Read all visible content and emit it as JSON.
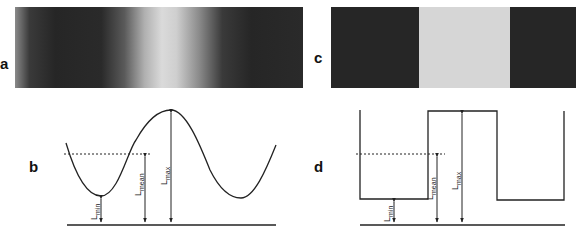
{
  "panels": {
    "a": {
      "label": "a",
      "type": "sinusoidal-grating"
    },
    "b": {
      "label": "b",
      "type": "sinusoidal-luminance-profile"
    },
    "c": {
      "label": "c",
      "type": "square-wave-grating"
    },
    "d": {
      "label": "d",
      "type": "square-wave-luminance-profile"
    }
  },
  "annotations": {
    "min": {
      "base": "L",
      "sub": "min"
    },
    "mean": {
      "base": "L",
      "sub": "mean"
    },
    "max": {
      "base": "L",
      "sub": "max"
    }
  },
  "colors": {
    "dark": "#262626",
    "light": "#d6d6d6",
    "line": "#222222"
  }
}
